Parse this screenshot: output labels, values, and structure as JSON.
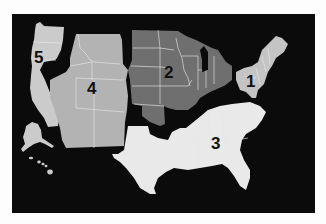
{
  "map": {
    "title": "US regions map",
    "background_color": "#0b0b0b",
    "page_background": "#fdfdfd",
    "regions": [
      {
        "id": "1",
        "label": "1",
        "name": "Northeast",
        "color": "#c4c4c4"
      },
      {
        "id": "2",
        "label": "2",
        "name": "Midwest",
        "color": "#6f6f6f"
      },
      {
        "id": "3",
        "label": "3",
        "name": "South",
        "color": "#e9e9e9"
      },
      {
        "id": "4",
        "label": "4",
        "name": "Mountain / Southwest",
        "color": "#b3b3b3"
      },
      {
        "id": "5",
        "label": "5",
        "name": "Pacific / West Coast incl. Alaska & Hawaii",
        "color": "#cbcbcb"
      }
    ]
  }
}
